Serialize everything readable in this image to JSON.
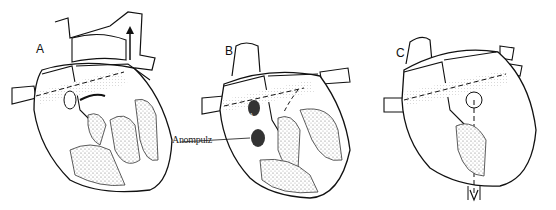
{
  "figure": {
    "panels": [
      {
        "label": "A"
      },
      {
        "label": "B",
        "annotation": "Anompulz",
        "inset_label": "DA"
      },
      {
        "label": "C"
      }
    ]
  },
  "colors": {
    "ink": "#111111",
    "stipple": "#cfcfcf",
    "dark_fill": "#333333",
    "background": "#ffffff"
  }
}
